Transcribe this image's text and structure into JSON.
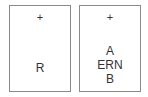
{
  "panels": [
    {
      "id": "left",
      "marker": "+",
      "labels": [
        "R"
      ]
    },
    {
      "id": "right",
      "marker": "+",
      "labels": [
        "A",
        "ERN",
        "B"
      ]
    }
  ]
}
